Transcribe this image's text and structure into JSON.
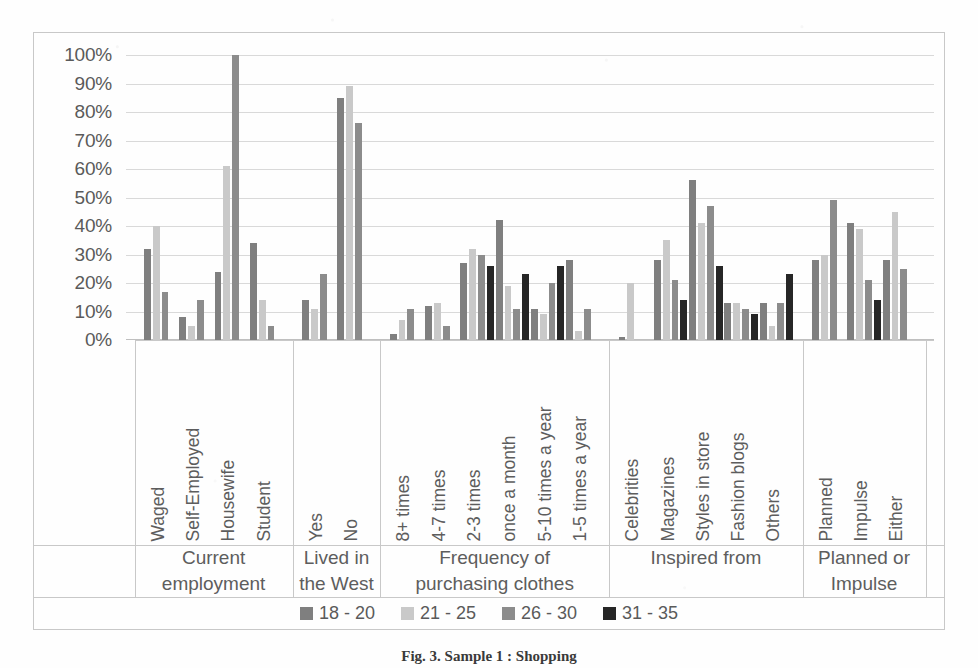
{
  "figure": {
    "caption": "Fig. 3.  Sample 1 : Shopping",
    "y_axis_unit": "%"
  },
  "legend": {
    "position": "bottom-center",
    "items": [
      {
        "label": "18 - 20",
        "color": "#7f7f7f"
      },
      {
        "label": "21 - 25",
        "color": "#c9c9c9"
      },
      {
        "label": "26 - 30",
        "color": "#8c8c8c"
      },
      {
        "label": "31 - 35",
        "color": "#262626"
      }
    ]
  },
  "chart_data": {
    "type": "bar",
    "title": "",
    "subtitle": "",
    "xlabel": "",
    "ylabel": "",
    "ylim": [
      0,
      100
    ],
    "ytick_labels": [
      "0%",
      "10%",
      "20%",
      "30%",
      "40%",
      "50%",
      "60%",
      "70%",
      "80%",
      "90%",
      "100%"
    ],
    "ytick_values": [
      0,
      10,
      20,
      30,
      40,
      50,
      60,
      70,
      80,
      90,
      100
    ],
    "grid": true,
    "grid_axis": "y",
    "series_names": [
      "18 - 20",
      "21 - 25",
      "26 - 30",
      "31 - 35"
    ],
    "series_colors": [
      "#7f7f7f",
      "#c9c9c9",
      "#8c8c8c",
      "#262626"
    ],
    "groups": [
      {
        "title": "Current employment",
        "title_lines": [
          "Current",
          "employment"
        ],
        "categories": [
          "Waged",
          "Self-Employed",
          "Housewife",
          "Student"
        ],
        "values": [
          [
            0,
            32,
            40,
            17
          ],
          [
            0,
            8,
            5,
            14
          ],
          [
            0,
            24,
            61,
            100
          ],
          [
            0,
            34,
            14,
            5
          ]
        ]
      },
      {
        "title": "Lived in the West",
        "title_lines": [
          "Lived in",
          "the West"
        ],
        "categories": [
          "Yes",
          "No"
        ],
        "values": [
          [
            0,
            14,
            11,
            23
          ],
          [
            0,
            85,
            89,
            76
          ]
        ]
      },
      {
        "title": "Frequency of purchasing clothes",
        "title_lines": [
          "Frequency of",
          "purchasing clothes"
        ],
        "categories": [
          "8+ times",
          "4-7 times",
          "2-3 times",
          "once a month",
          "5-10 times a year",
          "1-5 times a year"
        ],
        "values": [
          [
            0,
            2,
            7,
            11
          ],
          [
            0,
            12,
            13,
            5
          ],
          [
            0,
            27,
            32,
            30,
            26
          ],
          [
            0,
            42,
            19,
            11,
            23,
            28
          ],
          [
            0,
            11,
            9,
            20,
            26
          ],
          [
            0,
            28,
            3,
            11
          ]
        ]
      },
      {
        "title": "Inspired from",
        "title_lines": [
          "Inspired from"
        ],
        "categories": [
          "Celebrities",
          "Magazines",
          "Styles in store",
          "Fashion blogs",
          "Others"
        ],
        "values": [
          [
            0,
            1,
            20
          ],
          [
            0,
            28,
            35,
            21,
            14
          ],
          [
            0,
            56,
            41,
            47,
            26
          ],
          [
            0,
            13,
            13,
            11,
            9
          ],
          [
            0,
            13,
            5,
            13,
            23
          ]
        ]
      },
      {
        "title": "Planned or Impulse",
        "title_lines": [
          "Planned or",
          "Impulse"
        ],
        "categories": [
          "Planned",
          "Impulse",
          "Either"
        ],
        "values": [
          [
            0,
            28,
            30,
            49
          ],
          [
            0,
            41,
            39,
            21,
            14
          ],
          [
            0,
            28,
            45,
            25
          ]
        ]
      }
    ]
  }
}
